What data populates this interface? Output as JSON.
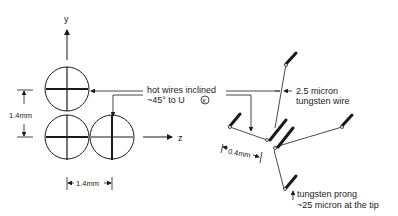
{
  "left_view": {
    "y_axis_label": "y",
    "z_axis_label": "z",
    "vertical_dimension": "1.4mm",
    "horizontal_dimension": "1.4mm"
  },
  "callouts": {
    "hot_wires_line1": "hot wires inclined",
    "hot_wires_line2": "~45° to U",
    "hot_wires_symbol": "x",
    "wire_line1": "2.5 micron",
    "wire_line2": "tungsten wire",
    "prong_spacing": "0.4mm",
    "prong_line1": "tungsten prong",
    "prong_line2": "~25 micron at the tip"
  },
  "colors": {
    "ink": "#1a1a1a",
    "background": "#ffffff"
  }
}
